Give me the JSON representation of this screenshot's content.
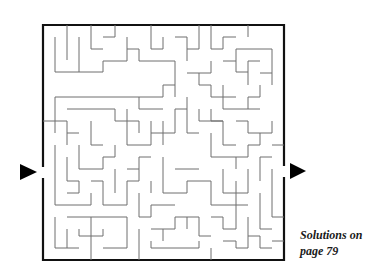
{
  "puzzle": {
    "type": "maze",
    "entrance_arrow": {
      "side": "left",
      "icon": "right-pointing-triangle"
    },
    "exit_arrow": {
      "side": "right",
      "icon": "right-pointing-triangle"
    },
    "colors": {
      "border": "#111111",
      "walls": "#6e6e6e",
      "arrows": "#000000",
      "background": "#ffffff"
    }
  },
  "caption": {
    "line1": "Solutions on",
    "line2": "page 79"
  }
}
